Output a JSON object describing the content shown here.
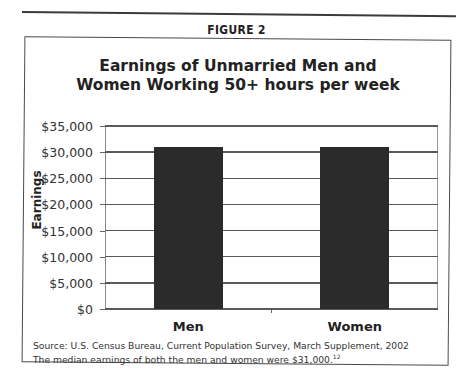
{
  "figure_label": "FIGURE 2",
  "chart_data": {
    "type": "bar",
    "title": "Earnings of Unmarried Men and Women Working 50+ hours per week",
    "title_lines": [
      "Earnings of Unmarried Men and",
      "Women Working 50+ hours per week"
    ],
    "categories": [
      "Men",
      "Women"
    ],
    "values": [
      31000,
      31000
    ],
    "xlabel": "",
    "ylabel": "Earnings",
    "ylim": [
      0,
      35000
    ],
    "yticks": [
      "$0",
      "$5,000",
      "$10,000",
      "$15,000",
      "$20,000",
      "$25,000",
      "$30,000",
      "$35,000"
    ],
    "grid": true,
    "legend": null,
    "bar_color": "#2b2b2b"
  },
  "source_text": "Source: U.S. Census Bureau, Current Population Survey, March Supplement, 2002",
  "note_text": "The median earnings of both the men and women were $31,000.",
  "note_superscript": "12"
}
